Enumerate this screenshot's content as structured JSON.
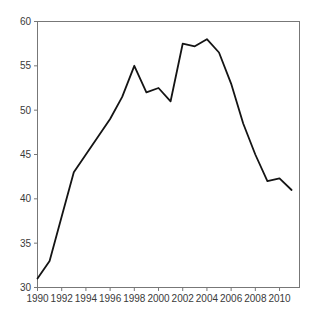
{
  "window": {
    "background": "#ffffff"
  },
  "chart_data": {
    "type": "line",
    "title": "",
    "xlabel": "",
    "ylabel": "",
    "x": [
      1990,
      1991,
      1992,
      1993,
      1994,
      1995,
      1996,
      1997,
      1998,
      1999,
      2000,
      2001,
      2002,
      2003,
      2004,
      2005,
      2006,
      2007,
      2008,
      2009,
      2010,
      2011
    ],
    "values": [
      31,
      33,
      38,
      43,
      45,
      47,
      49,
      51.5,
      55,
      52,
      52.5,
      51,
      57.5,
      57.2,
      58,
      56.5,
      53,
      48.5,
      45,
      42,
      42.3,
      41
    ],
    "x_ticks": [
      1990,
      1992,
      1994,
      1996,
      1998,
      2000,
      2002,
      2004,
      2006,
      2008,
      2010
    ],
    "y_ticks": [
      30,
      35,
      40,
      45,
      50,
      55,
      60
    ],
    "xlim": [
      1990,
      2011.65
    ],
    "ylim": [
      30,
      60
    ],
    "grid": false,
    "legend": false,
    "line_color": "#141414",
    "line_width": 1.8,
    "axis_color": "#777777",
    "tick_label_color": "#3a3a3a",
    "plot_background": "#ffffff"
  }
}
